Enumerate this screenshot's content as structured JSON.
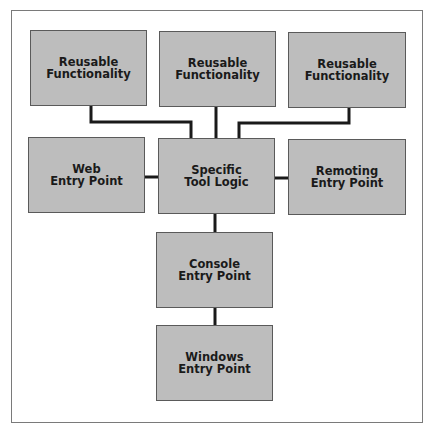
{
  "diagram": {
    "nodes": [
      {
        "id": "reusable-1",
        "lines": [
          "Reusable",
          "Functionality"
        ],
        "x": 30,
        "y": 30,
        "w": 117,
        "h": 76
      },
      {
        "id": "reusable-2",
        "lines": [
          "Reusable",
          "Functionality"
        ],
        "x": 159,
        "y": 31,
        "w": 117,
        "h": 76
      },
      {
        "id": "reusable-3",
        "lines": [
          "Reusable",
          "Functionality"
        ],
        "x": 288,
        "y": 32,
        "w": 118,
        "h": 76
      },
      {
        "id": "web-entry",
        "lines": [
          "Web",
          "Entry Point"
        ],
        "x": 28,
        "y": 137,
        "w": 117,
        "h": 76
      },
      {
        "id": "specific-tool-logic",
        "lines": [
          "Specific",
          "Tool Logic"
        ],
        "x": 158,
        "y": 138,
        "w": 117,
        "h": 76
      },
      {
        "id": "remoting-entry",
        "lines": [
          "Remoting",
          "Entry Point"
        ],
        "x": 288,
        "y": 139,
        "w": 118,
        "h": 76
      },
      {
        "id": "console-entry",
        "lines": [
          "Console",
          "Entry Point"
        ],
        "x": 156,
        "y": 232,
        "w": 117,
        "h": 76
      },
      {
        "id": "windows-entry",
        "lines": [
          "Windows",
          "Entry Point"
        ],
        "x": 156,
        "y": 325,
        "w": 117,
        "h": 76
      }
    ],
    "edges": [
      {
        "from": "reusable-1",
        "to": "specific-tool-logic"
      },
      {
        "from": "reusable-2",
        "to": "specific-tool-logic"
      },
      {
        "from": "reusable-3",
        "to": "specific-tool-logic"
      },
      {
        "from": "web-entry",
        "to": "specific-tool-logic"
      },
      {
        "from": "specific-tool-logic",
        "to": "remoting-entry"
      },
      {
        "from": "specific-tool-logic",
        "to": "console-entry"
      },
      {
        "from": "console-entry",
        "to": "windows-entry"
      }
    ],
    "colors": {
      "box_fill": "#bdbdbd",
      "box_border": "#5a5a5a",
      "line": "#1a1a1a",
      "frame": "#7a7a7a"
    }
  }
}
